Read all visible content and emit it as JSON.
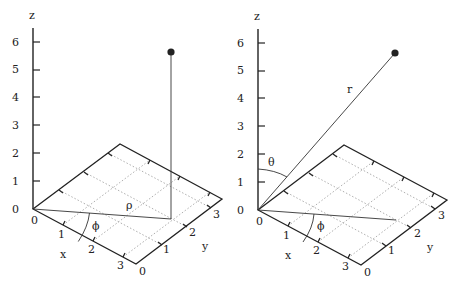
{
  "diagram": {
    "left_panel": {
      "title": "Cylindrical coordinates",
      "z_axis_label": "z",
      "x_axis_label": "x",
      "y_axis_label": "y",
      "z_ticks": [
        "0",
        "1",
        "2",
        "3",
        "4",
        "5",
        "6"
      ],
      "x_ticks": [
        "0",
        "1",
        "2",
        "3"
      ],
      "y_ticks": [
        "0",
        "1",
        "2",
        "3"
      ],
      "labels": {
        "rho": "ρ",
        "phi": "ϕ"
      }
    },
    "right_panel": {
      "title": "Spherical coordinates",
      "z_axis_label": "z",
      "x_axis_label": "x",
      "y_axis_label": "y",
      "z_ticks": [
        "0",
        "1",
        "2",
        "3",
        "4",
        "5",
        "6"
      ],
      "x_ticks": [
        "0",
        "1",
        "2",
        "3"
      ],
      "y_ticks": [
        "0",
        "1",
        "2",
        "3"
      ],
      "labels": {
        "r": "r",
        "theta": "θ",
        "phi": "ϕ"
      }
    },
    "point_color": "#222222"
  }
}
